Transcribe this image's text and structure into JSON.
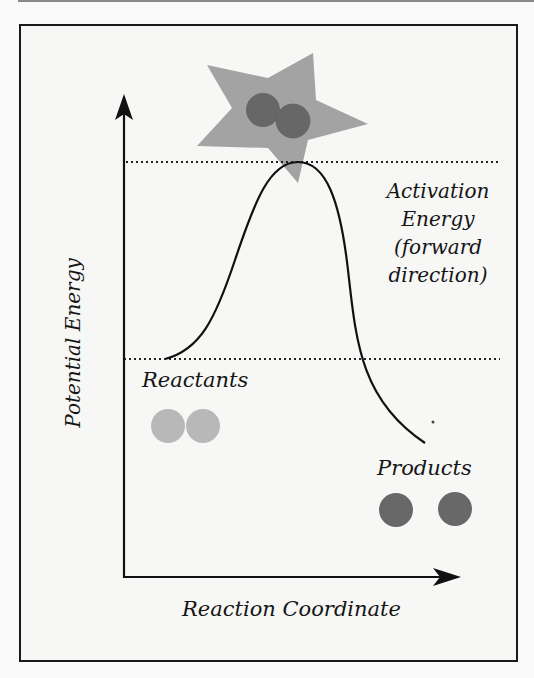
{
  "diagram": {
    "axes": {
      "y_label": "Potential Energy",
      "x_label": "Reaction Coordinate"
    },
    "annotations": {
      "activation_energy": [
        "Activation",
        "Energy",
        "(forward",
        "direction)"
      ],
      "reactants": "Reactants",
      "products": "Products"
    },
    "colors": {
      "star": "#a3a3a3",
      "transition_molecule": "#676767",
      "reactant_atoms": "#b8b8b8",
      "product_atoms": "#686868",
      "line": "#111111"
    },
    "levels": {
      "transition_state_line": "upper dotted line",
      "reactant_level_line": "lower dotted line"
    }
  }
}
